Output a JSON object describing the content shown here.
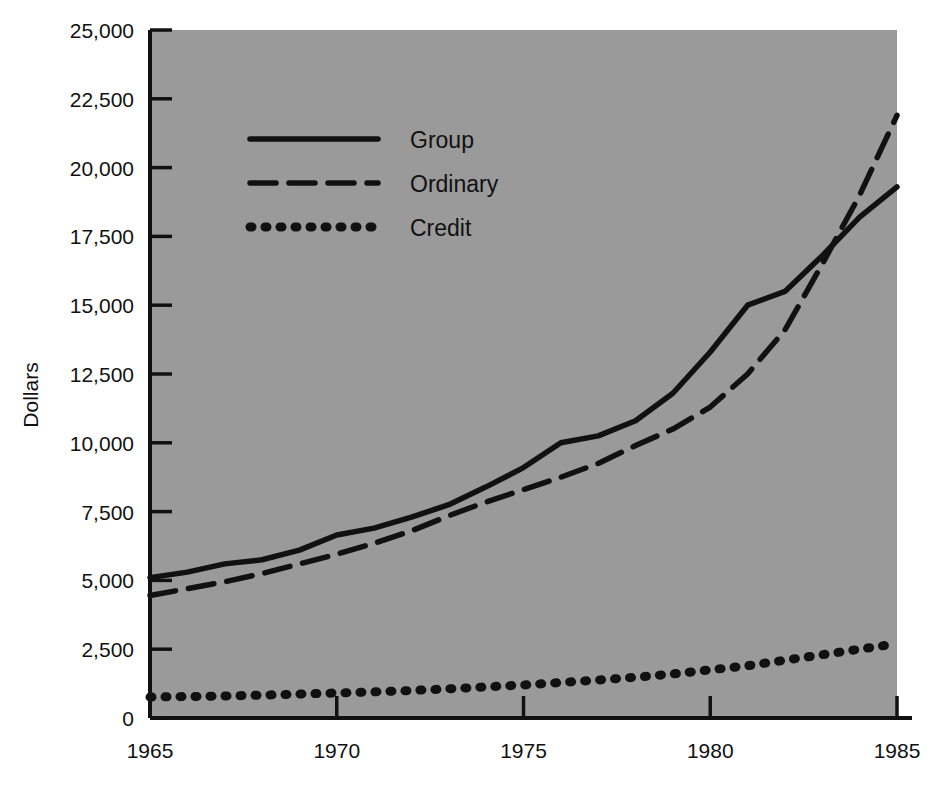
{
  "chart_data": {
    "type": "line",
    "title": "",
    "subtitle": "",
    "xlabel": "",
    "ylabel": "Dollars",
    "xlim": [
      1965,
      1985
    ],
    "ylim": [
      0,
      25000
    ],
    "grid": false,
    "legend_position": "upper-left-inside",
    "background_color": "#9a9a9a",
    "line_color": "#111111",
    "x": [
      1965,
      1966,
      1967,
      1968,
      1969,
      1970,
      1971,
      1972,
      1973,
      1974,
      1975,
      1976,
      1977,
      1978,
      1979,
      1980,
      1981,
      1982,
      1983,
      1984,
      1985
    ],
    "xticks": [
      1965,
      1970,
      1975,
      1980,
      1985
    ],
    "xtick_labels": [
      "1965",
      "1970",
      "1975",
      "1980",
      "1985"
    ],
    "yticks": [
      0,
      2500,
      5000,
      7500,
      10000,
      12500,
      15000,
      17500,
      20000,
      22500,
      25000
    ],
    "ytick_labels": [
      "0",
      "2,500",
      "5,000",
      "7,500",
      "10,000",
      "12,500",
      "15,000",
      "17,500",
      "20,000",
      "22,500",
      "25,000"
    ],
    "series": [
      {
        "name": "Group",
        "style": "solid",
        "values": [
          5100,
          5300,
          5600,
          5750,
          6100,
          6650,
          6900,
          7300,
          7750,
          8400,
          9100,
          10000,
          10250,
          10800,
          11800,
          13300,
          15000,
          15500,
          16800,
          18200,
          19300
        ]
      },
      {
        "name": "Ordinary",
        "style": "dashed",
        "values": [
          4450,
          4700,
          4950,
          5250,
          5600,
          5950,
          6350,
          6800,
          7350,
          7850,
          8300,
          8750,
          9250,
          9900,
          10500,
          11300,
          12500,
          14100,
          16500,
          19000,
          21900
        ]
      },
      {
        "name": "Credit",
        "style": "dotted",
        "values": [
          760,
          780,
          800,
          830,
          870,
          910,
          950,
          1000,
          1060,
          1130,
          1200,
          1290,
          1380,
          1480,
          1600,
          1750,
          1900,
          2100,
          2300,
          2500,
          2700
        ]
      }
    ]
  },
  "legend": {
    "items": [
      {
        "label": "Group",
        "style": "solid"
      },
      {
        "label": "Ordinary",
        "style": "dashed"
      },
      {
        "label": "Credit",
        "style": "dotted"
      }
    ]
  },
  "axes": {
    "y_axis_title": "Dollars"
  }
}
